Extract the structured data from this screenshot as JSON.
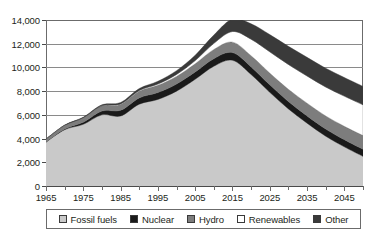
{
  "chart_data": {
    "type": "area",
    "stacked": true,
    "title": "",
    "subtitle": "",
    "xlabel": "",
    "ylabel": "",
    "xlim": [
      1965,
      2050
    ],
    "ylim": [
      0,
      14000
    ],
    "ytick_values": [
      0,
      2000,
      4000,
      6000,
      8000,
      10000,
      12000,
      14000
    ],
    "ytick_labels": [
      "0",
      "2,000",
      "4,000",
      "6,000",
      "8,000",
      "10,000",
      "12,000",
      "14,000"
    ],
    "xtick_values": [
      1965,
      1975,
      1985,
      1995,
      2005,
      2015,
      2025,
      2035,
      2045
    ],
    "xtick_labels": [
      "1965",
      "1975",
      "1985",
      "1995",
      "2005",
      "2015",
      "2025",
      "2035",
      "2045"
    ],
    "xtick_minor_values": [
      1970,
      1980,
      1990,
      2000,
      2010,
      2020,
      2030,
      2040,
      2050
    ],
    "grid": "horizontal",
    "legend_position": "bottom",
    "x": [
      1965,
      1970,
      1975,
      1980,
      1985,
      1990,
      1995,
      2000,
      2005,
      2010,
      2015,
      2020,
      2025,
      2030,
      2035,
      2040,
      2045,
      2050
    ],
    "series": [
      {
        "name": "Fossil fuels",
        "color": "#c9c9c9",
        "values": [
          3700,
          4750,
          5200,
          6000,
          5900,
          6900,
          7300,
          8000,
          9000,
          10100,
          10600,
          9400,
          7900,
          6500,
          5300,
          4200,
          3300,
          2500
        ]
      },
      {
        "name": "Nuclear",
        "color": "#1a1a1a",
        "values": [
          20,
          60,
          180,
          330,
          480,
          530,
          580,
          600,
          620,
          640,
          650,
          640,
          630,
          620,
          610,
          600,
          600,
          600
        ]
      },
      {
        "name": "Hydro",
        "color": "#7d7d7d",
        "values": [
          230,
          300,
          370,
          430,
          500,
          560,
          610,
          640,
          680,
          770,
          880,
          940,
          990,
          1030,
          1070,
          1100,
          1130,
          1150
        ]
      },
      {
        "name": "Renewables",
        "color": "#ffffff",
        "values": [
          5,
          8,
          15,
          25,
          45,
          70,
          110,
          170,
          280,
          520,
          900,
          1400,
          1800,
          2100,
          2300,
          2450,
          2550,
          2600
        ]
      },
      {
        "name": "Other",
        "color": "#3a3a3a",
        "values": [
          10,
          20,
          40,
          70,
          110,
          160,
          230,
          320,
          450,
          700,
          1050,
          1300,
          1450,
          1530,
          1570,
          1580,
          1570,
          1550
        ]
      }
    ],
    "legend_entries": [
      {
        "label": "Fossil fuels",
        "color": "#c9c9c9"
      },
      {
        "label": "Nuclear",
        "color": "#1a1a1a"
      },
      {
        "label": "Hydro",
        "color": "#7d7d7d"
      },
      {
        "label": "Renewables",
        "color": "#ffffff"
      },
      {
        "label": "Other",
        "color": "#3a3a3a"
      }
    ]
  }
}
